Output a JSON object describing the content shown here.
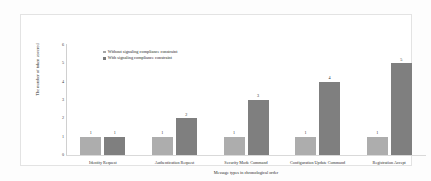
{
  "chart_data": {
    "type": "bar",
    "title": "",
    "xlabel": "Message types in chronological order",
    "ylabel": "The number of token covered",
    "categories": [
      "Identity Request",
      "Authentication Request",
      "Security Mode Command",
      "Configuration Update Command",
      "Registration Accept"
    ],
    "series": [
      {
        "name": "Without signaling compliance constraint",
        "color": "#adadad",
        "values": [
          1,
          1,
          1,
          1,
          1
        ]
      },
      {
        "name": "With signaling compliance constraint",
        "color": "#7f7f7f",
        "values": [
          1,
          2,
          3,
          4,
          5
        ]
      }
    ],
    "ylim": [
      0,
      6
    ],
    "yticks": [
      "0",
      "1",
      "2",
      "3",
      "4",
      "5",
      "6"
    ],
    "grid": false,
    "legend_position": "top-left",
    "data_labels": true
  },
  "figure": {
    "border_color": "#e3e3e3",
    "background": "#ffffff"
  }
}
